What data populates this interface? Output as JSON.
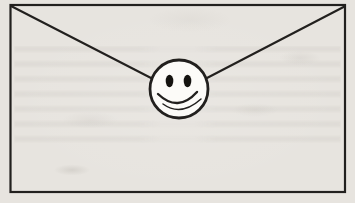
{
  "figure": {
    "kind": "scanned black-and-white line drawing",
    "subject": "sealed envelope with a smiley face at the flap point"
  },
  "colors": {
    "paper": "#e7e4df",
    "ink": "#22201e",
    "face_fill": "#fcfbf8",
    "eye": "#151310"
  }
}
